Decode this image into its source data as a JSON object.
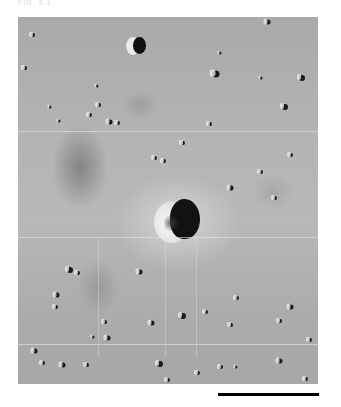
{
  "figure": {
    "top_label": "FIG. 3-1",
    "image_bounds": {
      "left": 18,
      "top": 17,
      "width": 300,
      "height": 367
    },
    "framelet_seams_y": [
      114,
      220,
      327
    ],
    "vertical_streaks_x": [
      80,
      147,
      178
    ],
    "main_crater": {
      "cx": 160,
      "cy": 204,
      "label": "central crater"
    },
    "top_crater": {
      "cx": 119,
      "cy": 28
    },
    "dark_patch": {
      "cx": 62,
      "cy": 150
    },
    "small_craters": [
      {
        "x": 15,
        "y": 18,
        "r": 2
      },
      {
        "x": 7,
        "y": 51,
        "r": 2
      },
      {
        "x": 79,
        "y": 69,
        "r": 1.5
      },
      {
        "x": 81,
        "y": 88,
        "r": 2
      },
      {
        "x": 72,
        "y": 98,
        "r": 2
      },
      {
        "x": 41,
        "y": 104,
        "r": 1.5
      },
      {
        "x": 92,
        "y": 105,
        "r": 2.5
      },
      {
        "x": 100,
        "y": 106,
        "r": 2
      },
      {
        "x": 32,
        "y": 90,
        "r": 1.5
      },
      {
        "x": 198,
        "y": 57,
        "r": 3.5
      },
      {
        "x": 250,
        "y": 5,
        "r": 2.5
      },
      {
        "x": 284,
        "y": 61,
        "r": 3
      },
      {
        "x": 267,
        "y": 90,
        "r": 3
      },
      {
        "x": 202,
        "y": 36,
        "r": 1.5
      },
      {
        "x": 243,
        "y": 61,
        "r": 1.5
      },
      {
        "x": 137,
        "y": 141,
        "r": 2
      },
      {
        "x": 146,
        "y": 144,
        "r": 2
      },
      {
        "x": 165,
        "y": 126,
        "r": 2
      },
      {
        "x": 213,
        "y": 171,
        "r": 2.5
      },
      {
        "x": 243,
        "y": 155,
        "r": 2
      },
      {
        "x": 273,
        "y": 138,
        "r": 2
      },
      {
        "x": 257,
        "y": 181,
        "r": 2
      },
      {
        "x": 192,
        "y": 107,
        "r": 2
      },
      {
        "x": 52,
        "y": 253,
        "r": 3
      },
      {
        "x": 60,
        "y": 256,
        "r": 2
      },
      {
        "x": 122,
        "y": 255,
        "r": 2.5
      },
      {
        "x": 39,
        "y": 278,
        "r": 2.5
      },
      {
        "x": 38,
        "y": 290,
        "r": 2
      },
      {
        "x": 87,
        "y": 305,
        "r": 2
      },
      {
        "x": 134,
        "y": 306,
        "r": 2.5
      },
      {
        "x": 90,
        "y": 321,
        "r": 2.5
      },
      {
        "x": 75,
        "y": 320,
        "r": 1.5
      },
      {
        "x": 17,
        "y": 334,
        "r": 2.5
      },
      {
        "x": 45,
        "y": 348,
        "r": 2.5
      },
      {
        "x": 25,
        "y": 346,
        "r": 2
      },
      {
        "x": 69,
        "y": 348,
        "r": 2
      },
      {
        "x": 142,
        "y": 347,
        "r": 3
      },
      {
        "x": 165,
        "y": 299,
        "r": 3
      },
      {
        "x": 188,
        "y": 295,
        "r": 2
      },
      {
        "x": 219,
        "y": 281,
        "r": 2
      },
      {
        "x": 273,
        "y": 290,
        "r": 2.5
      },
      {
        "x": 213,
        "y": 308,
        "r": 2
      },
      {
        "x": 262,
        "y": 304,
        "r": 2
      },
      {
        "x": 292,
        "y": 323,
        "r": 2
      },
      {
        "x": 262,
        "y": 344,
        "r": 2.5
      },
      {
        "x": 180,
        "y": 356,
        "r": 2
      },
      {
        "x": 203,
        "y": 350,
        "r": 2
      },
      {
        "x": 218,
        "y": 350,
        "r": 1.5
      },
      {
        "x": 288,
        "y": 362,
        "r": 2
      },
      {
        "x": 150,
        "y": 363,
        "r": 2
      }
    ]
  },
  "scale_bar": {
    "x1": 218,
    "x2": 319,
    "y": 393,
    "label": ""
  }
}
